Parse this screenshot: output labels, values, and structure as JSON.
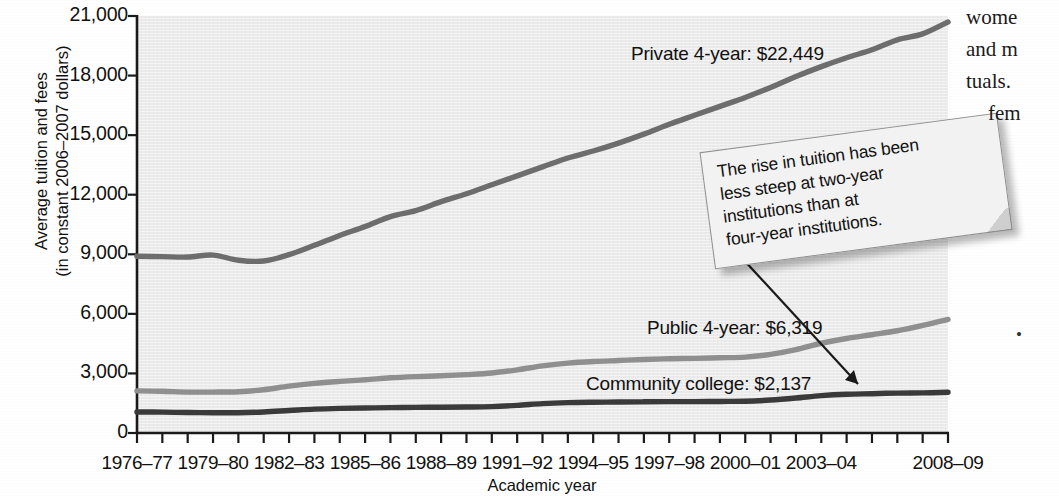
{
  "chart_data": {
    "type": "line",
    "title": "",
    "xlabel": "Academic year",
    "ylabel": "Average tuition and fees (in constant 2006–2007 dollars)",
    "ylabel_line1": "Average tuition and fees",
    "ylabel_line2": "(in constant 2006–2007 dollars)",
    "ylim": [
      0,
      21000
    ],
    "yticks": [
      0,
      3000,
      6000,
      9000,
      12000,
      15000,
      18000,
      21000
    ],
    "ytick_labels": [
      "0",
      "3,000",
      "6,000",
      "9,000",
      "12,000",
      "15,000",
      "18,000",
      "21,000"
    ],
    "grid": false,
    "legend": "inline-labels",
    "x_all_years": [
      "1976–77",
      "1977–78",
      "1978–79",
      "1979–80",
      "1980–81",
      "1981–82",
      "1982–83",
      "1983–84",
      "1984–85",
      "1985–86",
      "1986–87",
      "1987–88",
      "1988–89",
      "1989–90",
      "1990–91",
      "1991–92",
      "1992–93",
      "1993–94",
      "1994–95",
      "1995–96",
      "1996–97",
      "1997–98",
      "1998–99",
      "1999–2000",
      "2000–01",
      "2001–02",
      "2002–03",
      "2003–04",
      "2004–05",
      "2005–06",
      "2006–07",
      "2007–08",
      "2008–09"
    ],
    "xtick_labels": [
      "1976–77",
      "1979–80",
      "1982–83",
      "1985–86",
      "1988–89",
      "1991–92",
      "1994–95",
      "1997–98",
      "2000–01",
      "2003–04",
      "2008–09"
    ],
    "xtick_indices": [
      0,
      3,
      6,
      9,
      12,
      15,
      18,
      21,
      24,
      27,
      32
    ],
    "series": [
      {
        "name": "Private 4-year",
        "label": "Private 4-year: $22,449",
        "final_value": 22449,
        "color": "#6d6d6d",
        "values": [
          8900,
          8880,
          8860,
          8960,
          8700,
          8660,
          8980,
          9450,
          9950,
          10400,
          10900,
          11200,
          11650,
          12050,
          12500,
          12950,
          13400,
          13850,
          14200,
          14600,
          15050,
          15550,
          16000,
          16450,
          16900,
          17400,
          17950,
          18450,
          18900,
          19300,
          19800,
          20100,
          20700
        ]
      },
      {
        "name": "Public 4-year",
        "label": "Public 4-year: $6,319",
        "final_value": 6319,
        "color": "#8f8f8f",
        "values": [
          2120,
          2100,
          2060,
          2060,
          2080,
          2180,
          2360,
          2500,
          2600,
          2680,
          2780,
          2840,
          2880,
          2940,
          3020,
          3180,
          3380,
          3520,
          3600,
          3650,
          3700,
          3740,
          3760,
          3790,
          3820,
          3960,
          4200,
          4520,
          4760,
          4950,
          5150,
          5420,
          5720
        ]
      },
      {
        "name": "Community college",
        "label": "Community college: $2,137",
        "final_value": 2137,
        "color": "#3a3a3a",
        "values": [
          1060,
          1050,
          1030,
          1020,
          1020,
          1060,
          1130,
          1200,
          1240,
          1260,
          1280,
          1290,
          1300,
          1310,
          1330,
          1390,
          1480,
          1530,
          1550,
          1560,
          1570,
          1580,
          1580,
          1590,
          1600,
          1660,
          1760,
          1880,
          1950,
          1980,
          2010,
          2020,
          2050
        ]
      }
    ],
    "annotation": {
      "text": "The rise in tuition has been less steep at two-year institutions than at four-year institutions.",
      "lines": [
        "The rise in tuition has been",
        "less steep at two-year",
        "institutions than at",
        "four-year institutions."
      ],
      "points_to": "Community college"
    }
  },
  "series_labels": {
    "private": "Private 4-year: $22,449",
    "public": "Public 4-year: $6,319",
    "community": "Community college: $2,137"
  },
  "axes": {
    "y_title_line1": "Average tuition and fees",
    "y_title_line2": "(in constant 2006–2007 dollars)",
    "x_title": "Academic year"
  },
  "body_text": {
    "lines": [
      "wome",
      "and  m",
      "tuals.",
      "fem"
    ],
    "mark": "•"
  },
  "colors": {
    "plot_background": "#ebebeb",
    "private_line": "#6d6d6d",
    "public_line": "#8f8f8f",
    "community_line": "#3a3a3a",
    "axis": "#1a1a1a",
    "callout_bg": "#f2f2f2",
    "callout_border": "#8e8e8e"
  }
}
